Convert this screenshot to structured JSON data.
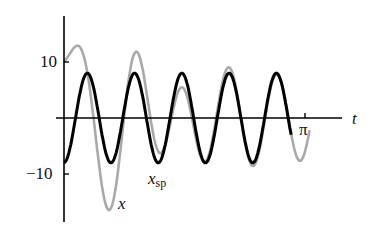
{
  "chart_data": {
    "type": "line",
    "title": "",
    "xlabel": "t",
    "ylabel": "",
    "xlim": [
      0,
      3.3
    ],
    "ylim": [
      -18.5,
      18.5
    ],
    "x_ticks": [
      {
        "value": 3.14159,
        "label": "π"
      }
    ],
    "y_ticks": [
      {
        "value": 10,
        "label": "10"
      },
      {
        "value": -10,
        "label": "−10"
      }
    ],
    "grid": false,
    "legend": "inline labels",
    "series": [
      {
        "name": "x",
        "label": "x",
        "color": "#a9a9a9",
        "style": "solid, thin gray",
        "description": "Full solution = steady-state + decaying transient; starts at 10, peaks ~12, dips to ~-17.5 near t≈0.59, converges to x_sp",
        "points": [
          [
            0,
            10
          ],
          [
            0.21,
            12.4
          ],
          [
            0.59,
            -17.5
          ],
          [
            0.81,
            7.6
          ],
          [
            1.0,
            -2.7
          ],
          [
            1.06,
            8.2
          ],
          [
            1.3,
            -9.2
          ],
          [
            1.45,
            7.8
          ],
          [
            1.56,
            -9.3
          ],
          [
            1.86,
            7.5
          ],
          [
            1.99,
            -8.9
          ],
          [
            2.22,
            7.5
          ],
          [
            2.3,
            -8.8
          ],
          [
            2.5,
            7.6
          ],
          [
            2.6,
            -8.6
          ],
          [
            2.86,
            7.2
          ],
          [
            3.2,
            2.6
          ]
        ]
      },
      {
        "name": "x_sp",
        "label": "x_sp",
        "color": "#000000",
        "style": "solid, thick black",
        "description": "Steady periodic solution ≈ -8 cos(10t)",
        "amplitude": 8,
        "omega": 10,
        "points": [
          [
            0,
            -7.5
          ],
          [
            0.095,
            0
          ],
          [
            0.31,
            7.8
          ],
          [
            0.48,
            -8.0
          ],
          [
            0.73,
            7.8
          ],
          [
            0.97,
            -8.0
          ],
          [
            1.16,
            8
          ],
          [
            1.36,
            -8.1
          ],
          [
            1.56,
            7.7
          ],
          [
            2.0,
            -8.5
          ],
          [
            2.45,
            7.6
          ],
          [
            2.8,
            -8.8
          ],
          [
            2.92,
            7.3
          ]
        ]
      }
    ],
    "annotations": [
      {
        "text": "x",
        "near": "gray curve trough"
      },
      {
        "text": "x_sp",
        "near": "black curve trough"
      }
    ]
  },
  "labels": {
    "y_tick_pos": "10",
    "y_tick_neg": "−10",
    "x_axis": "t",
    "x_tick_pi": "π",
    "curve_x": "x",
    "curve_xsp_main": "x",
    "curve_xsp_sub": "sp"
  }
}
